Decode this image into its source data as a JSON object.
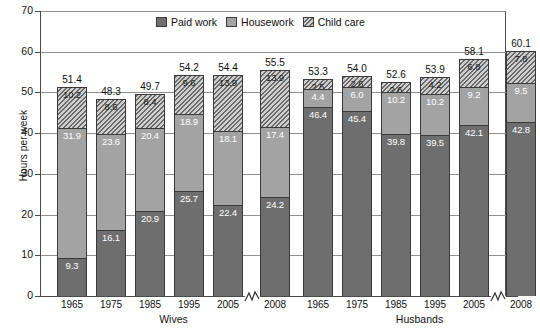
{
  "chart_data": {
    "type": "bar",
    "subtype": "stacked-bar-grouped",
    "title": "",
    "xlabel": "",
    "ylabel": "Hours per week",
    "ylim": [
      0,
      70
    ],
    "ytick_step": 10,
    "ytick_labels": [
      "0",
      "10",
      "20",
      "30",
      "40",
      "50",
      "60",
      "70"
    ],
    "grid": true,
    "legend_position": "top-center",
    "axis_break_between": [
      "2005",
      "2008"
    ],
    "categories": [
      "1965",
      "1975",
      "1985",
      "1995",
      "2005",
      "2008"
    ],
    "groups": [
      "Wives",
      "Husbands"
    ],
    "series": [
      {
        "name": "Paid work",
        "color": "#6e6e6e",
        "pattern": "solid"
      },
      {
        "name": "Housework",
        "color": "#a3a3a3",
        "pattern": "solid"
      },
      {
        "name": "Child care",
        "color": "#cfcfcf",
        "pattern": "diagonal-hatch"
      }
    ],
    "data": {
      "Wives": {
        "Paid work": [
          9.3,
          16.1,
          20.9,
          25.7,
          22.4,
          24.2
        ],
        "Housework": [
          31.9,
          23.6,
          20.4,
          18.9,
          18.1,
          17.4
        ],
        "Child care": [
          10.2,
          8.6,
          8.4,
          9.6,
          13.9,
          13.9
        ],
        "Totals": [
          51.4,
          48.3,
          49.7,
          54.2,
          54.4,
          55.5
        ]
      },
      "Husbands": {
        "Paid work": [
          46.4,
          45.4,
          39.8,
          39.5,
          42.1,
          42.8
        ],
        "Housework": [
          4.4,
          6.0,
          10.2,
          10.2,
          9.2,
          9.5
        ],
        "Child care": [
          2.5,
          2.6,
          2.6,
          4.2,
          6.8,
          7.8
        ],
        "Totals": [
          53.3,
          54.0,
          52.6,
          53.9,
          58.1,
          60.1
        ]
      }
    }
  },
  "legend": {
    "items": [
      {
        "label": "Paid work"
      },
      {
        "label": "Housework"
      },
      {
        "label": "Child care"
      }
    ]
  },
  "axis": {
    "y_title": "Hours per week"
  }
}
